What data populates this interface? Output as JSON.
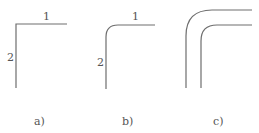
{
  "figures": [
    {
      "id": "a",
      "caption": "a)",
      "edge_labels": {
        "top": "1",
        "left": "2"
      },
      "corner": "sharp"
    },
    {
      "id": "b",
      "caption": "b)",
      "edge_labels": {
        "top": "1",
        "left": "2"
      },
      "corner": "rounded"
    },
    {
      "id": "c",
      "caption": "c)",
      "edge_labels": {},
      "corner": "double-rounded"
    }
  ],
  "colors": {
    "line": "#6e6e6e",
    "text": "#555555"
  }
}
